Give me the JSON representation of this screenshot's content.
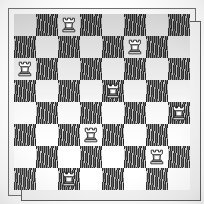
{
  "diagram": {
    "kind": "chess-board-diagram",
    "title": "",
    "style_note": "engraved/hatched print scan",
    "board": {
      "files": [
        "a",
        "b",
        "c",
        "d",
        "e",
        "f",
        "g",
        "h"
      ],
      "ranks": [
        "8",
        "7",
        "6",
        "5",
        "4",
        "3",
        "2",
        "1"
      ],
      "size": 8,
      "square_px": 22,
      "light_color": "#ffffff",
      "dark_color": "#bdbdbd",
      "dark_fill": "vertical-hatch",
      "frame_color": "#6e6e6e",
      "coordinates_shown": false
    },
    "pieces": [
      {
        "type": "rook",
        "color": "white",
        "glyph": "rook-icon",
        "square": "c8",
        "col": 2,
        "row": 0,
        "on_dark": true
      },
      {
        "type": "rook",
        "color": "white",
        "glyph": "rook-icon",
        "square": "f7",
        "col": 5,
        "row": 1,
        "on_dark": false
      },
      {
        "type": "rook",
        "color": "white",
        "glyph": "rook-icon",
        "square": "a6",
        "col": 0,
        "row": 2,
        "on_dark": false
      },
      {
        "type": "rook",
        "color": "white",
        "glyph": "rook-icon",
        "square": "e5",
        "col": 4,
        "row": 3,
        "on_dark": true
      },
      {
        "type": "rook",
        "color": "white",
        "glyph": "rook-icon",
        "square": "h4",
        "col": 7,
        "row": 4,
        "on_dark": false
      },
      {
        "type": "rook",
        "color": "white",
        "glyph": "rook-icon",
        "square": "d3",
        "col": 3,
        "row": 5,
        "on_dark": false
      },
      {
        "type": "rook",
        "color": "white",
        "glyph": "rook-icon",
        "square": "g2",
        "col": 6,
        "row": 6,
        "on_dark": false
      },
      {
        "type": "rook",
        "color": "white",
        "glyph": "rook-icon",
        "square": "c1",
        "col": 2,
        "row": 7,
        "on_dark": true
      }
    ]
  }
}
